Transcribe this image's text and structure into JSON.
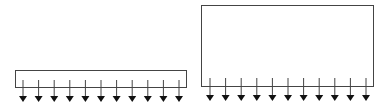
{
  "diagram": {
    "stroke_color": "#444444",
    "arrow_color": "#111111",
    "panels": [
      {
        "name": "short-box",
        "box": {
          "x": 15,
          "y": 70,
          "w": 171,
          "h": 17
        },
        "arrow_count": 11,
        "arrow_x_start": 23,
        "arrow_x_end": 179,
        "arrow_top": 80,
        "arrow_tip": 102
      },
      {
        "name": "tall-box",
        "box": {
          "x": 201,
          "y": 5,
          "w": 172,
          "h": 81
        },
        "arrow_count": 11,
        "arrow_x_start": 210,
        "arrow_x_end": 366,
        "arrow_top": 78,
        "arrow_tip": 101
      }
    ]
  }
}
